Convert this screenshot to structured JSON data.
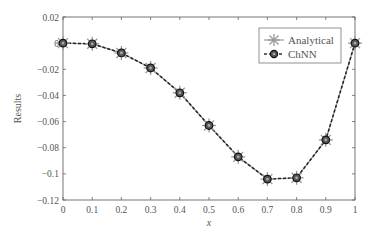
{
  "chart_data": {
    "type": "line",
    "title": "",
    "xlabel": "x",
    "ylabel": "Results",
    "xlim": [
      0,
      1
    ],
    "ylim": [
      -0.12,
      0.02
    ],
    "xticks": [
      "0",
      "0.1",
      "0.2",
      "0.3",
      "0.4",
      "0.5",
      "0.6",
      "0.7",
      "0.8",
      "0.9",
      "1"
    ],
    "yticks": [
      "0.02",
      "0",
      "−0.02",
      "−0.04",
      "−0.06",
      "−0.08",
      "−0.1",
      "−0.12"
    ],
    "grid": false,
    "legend_position": "upper right",
    "x": [
      0,
      0.1,
      0.2,
      0.3,
      0.4,
      0.5,
      0.6,
      0.7,
      0.8,
      0.9,
      1.0
    ],
    "series": [
      {
        "name": "Analytical",
        "marker": "asterisk",
        "line": "solid",
        "color": "#888888",
        "values": [
          0,
          -0.0005,
          -0.0075,
          -0.019,
          -0.038,
          -0.063,
          -0.087,
          -0.104,
          -0.103,
          -0.074,
          0
        ]
      },
      {
        "name": "ChNN",
        "marker": "circle",
        "line": "dashed",
        "color": "#333333",
        "values": [
          0,
          -0.0005,
          -0.0075,
          -0.019,
          -0.038,
          -0.063,
          -0.087,
          -0.104,
          -0.103,
          -0.074,
          0
        ]
      }
    ]
  },
  "legend": {
    "items": [
      {
        "label": "Analytical"
      },
      {
        "label": "ChNN"
      }
    ]
  }
}
